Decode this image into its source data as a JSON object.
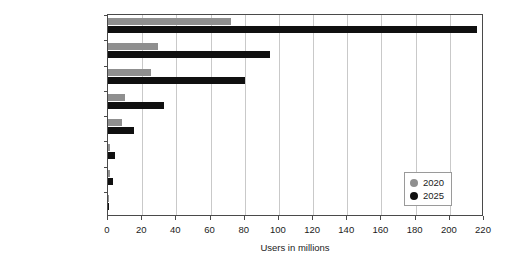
{
  "chart_data": {
    "type": "bar",
    "orientation": "horizontal",
    "title": "",
    "xlabel": "Users in millions",
    "ylabel": "",
    "xlim": [
      0,
      220
    ],
    "xticks": [
      0,
      20,
      40,
      60,
      80,
      100,
      120,
      140,
      160,
      180,
      200,
      220
    ],
    "grid": "vertical",
    "legend_position": "lower right",
    "categories": [
      "Video games",
      "Live events",
      "Video entertainment",
      "Retail",
      "Education",
      "Healthcare",
      "Engineering",
      "Real estate"
    ],
    "series": [
      {
        "name": "2020",
        "color": "#8f8f8f",
        "values": [
          72,
          29,
          25,
          10,
          8,
          1,
          1,
          0.4
        ]
      },
      {
        "name": "2025",
        "color": "#101010",
        "values": [
          216,
          95,
          80,
          33,
          15,
          4,
          3,
          0.6
        ]
      }
    ]
  },
  "legend": {
    "items": [
      {
        "label": "2020",
        "color": "#8f8f8f"
      },
      {
        "label": "2025",
        "color": "#101010"
      }
    ]
  }
}
